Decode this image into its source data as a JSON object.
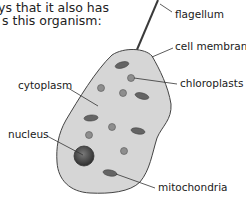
{
  "intro_text": {
    "line1": "ys that it also has",
    "line2": "s this organism:"
  },
  "labels": {
    "flagellum": "flagellum",
    "cell_membrane": "cell membrane",
    "cytoplasm": "cytoplasm",
    "chloroplasts": "chloroplasts",
    "nucleus": "nucleus",
    "mitochondria": "mitochondria"
  },
  "colors": {
    "cytoplasm_fill": "#d6d6d6",
    "membrane_stroke": "#444444",
    "organelle_dark": "#666666",
    "chloroplast_fill": "#8a8a8a",
    "nucleus_fill": "#4a4a4a"
  }
}
